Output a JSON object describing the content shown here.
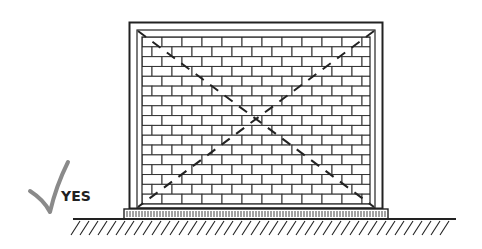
{
  "figure": {
    "verdict_label": "YES",
    "verdict_mark": "check-mark",
    "colors": {
      "line": "#222222",
      "check": "#8a8a8a",
      "background": "#ffffff"
    },
    "wall": {
      "brick_rows": 17,
      "brick_width_px": 20,
      "brick_height_px": 9.8
    }
  }
}
